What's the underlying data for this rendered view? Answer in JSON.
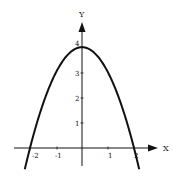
{
  "chart_data": {
    "type": "line",
    "title": "",
    "function": "y = 4 - x^2",
    "xlabel": "X",
    "ylabel": "Y",
    "xlim": [
      -2.6,
      2.9
    ],
    "ylim": [
      -0.7,
      5.0
    ],
    "x_ticks": [
      -2,
      -1,
      1,
      2
    ],
    "x_tick_labels": [
      "-2",
      "-1",
      "1",
      "2"
    ],
    "y_ticks": [
      1,
      2,
      3,
      4
    ],
    "y_tick_labels": [
      "1",
      "2",
      "3",
      "4"
    ],
    "grid": false,
    "legend": null,
    "series": [
      {
        "name": "parabola",
        "x": [
          -2.2,
          -2.0,
          -1.5,
          -1.0,
          -0.5,
          0.0,
          0.5,
          1.0,
          1.5,
          2.0,
          2.2
        ],
        "y": [
          -0.84,
          0.0,
          1.75,
          3.0,
          3.75,
          4.0,
          3.75,
          3.0,
          1.75,
          0.0,
          -0.84
        ],
        "color": "#111111"
      }
    ]
  }
}
